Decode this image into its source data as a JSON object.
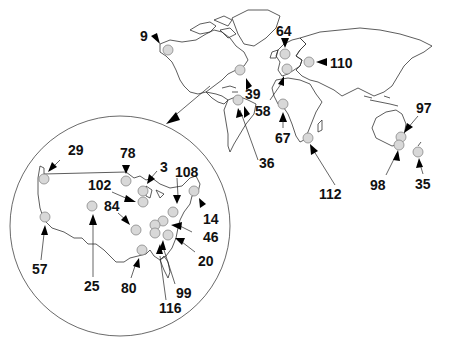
{
  "figure": {
    "type": "world-site-map",
    "inset": "United States enlargement (circle)",
    "colors": {
      "site_fill": "#d8d8d8",
      "site_stroke": "#888888",
      "outline": "#333333",
      "arrow": "#000000",
      "background": "#ffffff"
    }
  },
  "world_sites": [
    {
      "id": "9",
      "region": "Alaska",
      "label_x": 156,
      "label_y": 10,
      "site": [
        168,
        50
      ]
    },
    {
      "id": "64",
      "region": "Scandinavia/UK",
      "label_x": 272,
      "label_y": 22,
      "site": [
        285,
        54
      ]
    },
    {
      "id": "110",
      "region": "Eastern Europe",
      "label_x": 330,
      "label_y": 58,
      "site": [
        310,
        62
      ]
    },
    {
      "id": "39",
      "region": "Northeast US/Canada",
      "label_x": 248,
      "label_y": 88,
      "site": [
        240,
        70
      ]
    },
    {
      "id": "58",
      "region": "Northern S. America",
      "label_x": 255,
      "label_y": 106,
      "site": [
        238,
        100
      ]
    },
    {
      "id": "67",
      "region": "West Africa",
      "label_x": 275,
      "label_y": 132,
      "site": [
        283,
        104
      ]
    },
    {
      "id": "36",
      "region": "Brazil",
      "label_x": 260,
      "label_y": 158,
      "site": [
        238,
        100
      ]
    },
    {
      "id": "112",
      "region": "South Africa",
      "label_x": 318,
      "label_y": 187,
      "site": [
        308,
        139
      ]
    },
    {
      "id": "97",
      "region": "Eastern Australia",
      "label_x": 415,
      "label_y": 102,
      "site": [
        401,
        137
      ]
    },
    {
      "id": "98",
      "region": "Southeast Australia",
      "label_x": 373,
      "label_y": 186,
      "site": [
        399,
        145
      ]
    },
    {
      "id": "35",
      "region": "New Zealand",
      "label_x": 416,
      "label_y": 183,
      "site": [
        418,
        152
      ]
    },
    {
      "id": "europe-3",
      "region": "Western Europe",
      "label_x": null,
      "label_y": null,
      "site": [
        287,
        70
      ]
    }
  ],
  "us_inset_sites": [
    {
      "id": "29",
      "label": "29",
      "site": [
        44,
        179
      ]
    },
    {
      "id": "78",
      "label": "78",
      "site": [
        126,
        181
      ]
    },
    {
      "id": "3",
      "label": "3",
      "site": [
        143,
        192
      ]
    },
    {
      "id": "102",
      "label": "102",
      "site": [
        143,
        202
      ]
    },
    {
      "id": "108",
      "label": "108",
      "site": [
        173,
        210
      ]
    },
    {
      "id": "84",
      "label": "84",
      "site": [
        136,
        230
      ]
    },
    {
      "id": "14",
      "label": "14",
      "site": [
        194,
        191
      ]
    },
    {
      "id": "46",
      "label": "46",
      "site": [
        163,
        222
      ]
    },
    {
      "id": "20",
      "label": "20",
      "site": [
        169,
        235
      ]
    },
    {
      "id": "99",
      "label": "99",
      "site": [
        162,
        232
      ]
    },
    {
      "id": "116",
      "label": "116",
      "site": [
        156,
        234
      ]
    },
    {
      "id": "80",
      "label": "80",
      "site": [
        142,
        250
      ]
    },
    {
      "id": "25",
      "label": "25",
      "site": [
        92,
        207
      ]
    },
    {
      "id": "57",
      "label": "57",
      "site": [
        45,
        217
      ]
    }
  ],
  "labels": {
    "l9": "9",
    "l64": "64",
    "l110": "110",
    "l39": "39",
    "l58": "58",
    "l67": "67",
    "l36": "36",
    "l112": "112",
    "l97": "97",
    "l98": "98",
    "l35": "35",
    "l29": "29",
    "l78": "78",
    "l3": "3",
    "l102": "102",
    "l108": "108",
    "l84": "84",
    "l14": "14",
    "l46": "46",
    "l20": "20",
    "l99": "99",
    "l116": "116",
    "l80": "80",
    "l25": "25",
    "l57": "57"
  }
}
